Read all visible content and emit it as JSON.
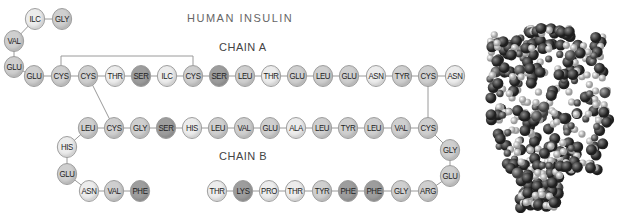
{
  "title": "HUMAN INSULIN",
  "labels": {
    "chain_a": "CHAIN A",
    "chain_b": "CHAIN B"
  },
  "colors": {
    "light": "#ececec",
    "mid": "#cfcfcf",
    "dark": "#9d9d9d",
    "line": "#9a9a9a"
  },
  "chain_a": [
    {
      "name": "GLY",
      "x": 62,
      "y": 19,
      "shade": "mid"
    },
    {
      "name": "ILC",
      "x": 35,
      "y": 19,
      "shade": "light"
    },
    {
      "name": "VAL",
      "x": 14,
      "y": 41,
      "shade": "mid"
    },
    {
      "name": "GLU",
      "x": 14,
      "y": 67,
      "shade": "mid"
    },
    {
      "name": "GLU",
      "x": 34,
      "y": 76,
      "shade": "mid"
    },
    {
      "name": "CYS",
      "x": 61,
      "y": 76,
      "shade": "mid"
    },
    {
      "name": "CYS",
      "x": 88,
      "y": 76,
      "shade": "mid"
    },
    {
      "name": "THR",
      "x": 115,
      "y": 76,
      "shade": "light"
    },
    {
      "name": "SER",
      "x": 141,
      "y": 76,
      "shade": "dark"
    },
    {
      "name": "ILC",
      "x": 167,
      "y": 76,
      "shade": "light"
    },
    {
      "name": "CYS",
      "x": 193,
      "y": 76,
      "shade": "mid"
    },
    {
      "name": "SER",
      "x": 219,
      "y": 76,
      "shade": "dark"
    },
    {
      "name": "LEU",
      "x": 245,
      "y": 76,
      "shade": "mid"
    },
    {
      "name": "THR",
      "x": 271,
      "y": 76,
      "shade": "light"
    },
    {
      "name": "GLU",
      "x": 297,
      "y": 76,
      "shade": "mid"
    },
    {
      "name": "LEU",
      "x": 323,
      "y": 76,
      "shade": "mid"
    },
    {
      "name": "GLU",
      "x": 349,
      "y": 76,
      "shade": "mid"
    },
    {
      "name": "ASN",
      "x": 376,
      "y": 76,
      "shade": "light"
    },
    {
      "name": "TYR",
      "x": 402,
      "y": 76,
      "shade": "mid"
    },
    {
      "name": "CYS",
      "x": 428,
      "y": 76,
      "shade": "mid"
    },
    {
      "name": "ASN",
      "x": 455,
      "y": 76,
      "shade": "light"
    }
  ],
  "chain_b": [
    {
      "name": "PHE",
      "x": 140,
      "y": 191,
      "shade": "dark"
    },
    {
      "name": "VAL",
      "x": 114,
      "y": 191,
      "shade": "mid"
    },
    {
      "name": "ASN",
      "x": 89,
      "y": 191,
      "shade": "light"
    },
    {
      "name": "GLU",
      "x": 67,
      "y": 174,
      "shade": "mid"
    },
    {
      "name": "HIS",
      "x": 67,
      "y": 147,
      "shade": "light"
    },
    {
      "name": "LEU",
      "x": 88,
      "y": 128,
      "shade": "mid"
    },
    {
      "name": "CYS",
      "x": 114,
      "y": 128,
      "shade": "mid"
    },
    {
      "name": "GLY",
      "x": 140,
      "y": 128,
      "shade": "mid"
    },
    {
      "name": "SER",
      "x": 166,
      "y": 128,
      "shade": "dark"
    },
    {
      "name": "HIS",
      "x": 192,
      "y": 128,
      "shade": "light"
    },
    {
      "name": "LEU",
      "x": 218,
      "y": 128,
      "shade": "mid"
    },
    {
      "name": "VAL",
      "x": 244,
      "y": 128,
      "shade": "mid"
    },
    {
      "name": "GLU",
      "x": 270,
      "y": 128,
      "shade": "mid"
    },
    {
      "name": "ALA",
      "x": 296,
      "y": 128,
      "shade": "light"
    },
    {
      "name": "LEU",
      "x": 322,
      "y": 128,
      "shade": "mid"
    },
    {
      "name": "TYR",
      "x": 348,
      "y": 128,
      "shade": "mid"
    },
    {
      "name": "LEU",
      "x": 374,
      "y": 128,
      "shade": "mid"
    },
    {
      "name": "VAL",
      "x": 401,
      "y": 128,
      "shade": "mid"
    },
    {
      "name": "CYS",
      "x": 428,
      "y": 128,
      "shade": "mid"
    },
    {
      "name": "GLY",
      "x": 450,
      "y": 150,
      "shade": "mid"
    },
    {
      "name": "GLU",
      "x": 450,
      "y": 176,
      "shade": "mid"
    },
    {
      "name": "ARG",
      "x": 428,
      "y": 191,
      "shade": "mid"
    },
    {
      "name": "GLY",
      "x": 401,
      "y": 191,
      "shade": "mid"
    },
    {
      "name": "PHE",
      "x": 374,
      "y": 191,
      "shade": "dark"
    },
    {
      "name": "PHE",
      "x": 348,
      "y": 191,
      "shade": "dark"
    },
    {
      "name": "TYR",
      "x": 322,
      "y": 191,
      "shade": "mid"
    },
    {
      "name": "THR",
      "x": 295,
      "y": 191,
      "shade": "light"
    },
    {
      "name": "PRO",
      "x": 269,
      "y": 191,
      "shade": "light"
    },
    {
      "name": "LYS",
      "x": 243,
      "y": 191,
      "shade": "dark"
    },
    {
      "name": "THR",
      "x": 217,
      "y": 191,
      "shade": "light"
    }
  ],
  "disulfide_bonds": [
    {
      "from": [
        61,
        76
      ],
      "to": [
        193,
        76
      ],
      "type": "bracket",
      "top": 56
    },
    {
      "from": [
        88,
        76
      ],
      "to": [
        114,
        128
      ],
      "type": "line"
    },
    {
      "from": [
        428,
        76
      ],
      "to": [
        428,
        128
      ],
      "type": "line"
    }
  ],
  "molecule_model": "space-filling-3d-model"
}
